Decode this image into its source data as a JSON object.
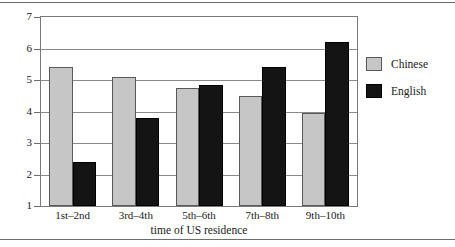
{
  "chart_data": {
    "type": "bar",
    "title": "",
    "xlabel": "time of US residence",
    "ylabel": "",
    "categories": [
      "1st–2nd",
      "3rd–4th",
      "5th–6th",
      "7th–8th",
      "9th–10th"
    ],
    "series": [
      {
        "name": "Chinese",
        "color": "#c6c6c6",
        "values": [
          5.4,
          5.1,
          4.75,
          4.5,
          3.95
        ]
      },
      {
        "name": "English",
        "color": "#141414",
        "values": [
          2.4,
          3.8,
          4.85,
          5.4,
          6.2
        ]
      }
    ],
    "ylim": [
      1,
      7
    ],
    "yticks": [
      1,
      2,
      3,
      4,
      5,
      6,
      7
    ],
    "ytick_labels": [
      "1",
      "2",
      "3",
      "4",
      "5",
      "6",
      "7"
    ],
    "grid": true,
    "legend_position": "right"
  },
  "legend": {
    "entries": [
      {
        "label": "Chinese"
      },
      {
        "label": "English"
      }
    ]
  },
  "axis": {
    "x_title": "time of US residence"
  }
}
